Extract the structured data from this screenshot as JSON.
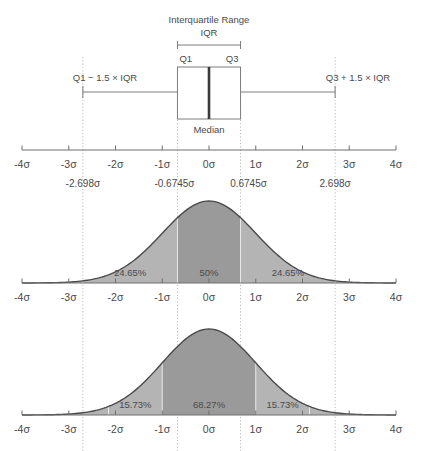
{
  "figure": {
    "title_visible": false,
    "axis": {
      "unit_suffix": "σ",
      "tick_labels": [
        "-4σ",
        "-3σ",
        "-2σ",
        "-1σ",
        "0σ",
        "1σ",
        "2σ",
        "3σ",
        "4σ"
      ],
      "tick_values": [
        -4,
        -3,
        -2,
        -1,
        0,
        1,
        2,
        3,
        4
      ],
      "range": [
        -4,
        4
      ]
    },
    "quartile_labels": {
      "lower_fence": "-2.698σ",
      "q1": "-0.6745σ",
      "q3": "0.6745σ",
      "upper_fence": "2.698σ"
    },
    "boxplot": {
      "iqr_title": "Interquartile Range",
      "iqr_abbrev": "IQR",
      "q1_label": "Q1",
      "q3_label": "Q3",
      "median_label": "Median",
      "lower_fence_label": "Q1 − 1.5 × IQR",
      "upper_fence_label": "Q3 + 1.5 × IQR",
      "q1_value": -0.6745,
      "q3_value": 0.6745,
      "median_value": 0,
      "lower_whisker_value": -2.698,
      "upper_whisker_value": 2.698
    },
    "colors": {
      "outer_fill": "#b4b4b4",
      "inner_fill": "#9a9a9a",
      "curve_stroke": "#4a4a4a",
      "axis_stroke": "#6e6e6e",
      "guide_stroke": "#b9b9b9",
      "text": "#4a4a4a",
      "median_stroke": "#3a3a3a"
    }
  },
  "chart_data": [
    {
      "type": "line",
      "name": "boxplot-panel",
      "title": "Interquartile Range",
      "xlabel": "",
      "ylabel": "",
      "xlim": [
        -4,
        4
      ],
      "grid": false,
      "tick_labels": [
        "-4σ",
        "-3σ",
        "-2σ",
        "-1σ",
        "0σ",
        "1σ",
        "2σ",
        "3σ",
        "4σ"
      ],
      "x": [
        -4,
        -3,
        -2,
        -1,
        0,
        1,
        2,
        3,
        4
      ],
      "boxplot_stats": {
        "whisker_low": -2.698,
        "q1": -0.6745,
        "median": 0,
        "q3": 0.6745,
        "whisker_high": 2.698
      },
      "annotations": [
        "Interquartile Range",
        "IQR",
        "Q1",
        "Q3",
        "Median",
        "Q1 − 1.5 × IQR",
        "Q3 + 1.5 × IQR",
        "-2.698σ",
        "-0.6745σ",
        "0.6745σ",
        "2.698σ"
      ]
    },
    {
      "type": "area",
      "name": "quartile-normal-curve",
      "title": "",
      "xlabel": "",
      "ylabel": "",
      "xlim": [
        -4,
        4
      ],
      "grid": false,
      "distribution": "standard normal",
      "tick_labels": [
        "-4σ",
        "-3σ",
        "-2σ",
        "-1σ",
        "0σ",
        "1σ",
        "2σ",
        "3σ",
        "4σ"
      ],
      "regions": [
        {
          "label": "24.65%",
          "value": 24.65,
          "from": -2.698,
          "to": -0.6745,
          "shade": "outer"
        },
        {
          "label": "50%",
          "value": 50,
          "from": -0.6745,
          "to": 0.6745,
          "shade": "inner"
        },
        {
          "label": "24.65%",
          "value": 24.65,
          "from": 0.6745,
          "to": 2.698,
          "shade": "outer"
        }
      ]
    },
    {
      "type": "area",
      "name": "sigma-normal-curve",
      "title": "",
      "xlabel": "",
      "ylabel": "",
      "xlim": [
        -4,
        4
      ],
      "grid": false,
      "distribution": "standard normal",
      "tick_labels": [
        "-4σ",
        "-3σ",
        "-2σ",
        "-1σ",
        "0σ",
        "1σ",
        "2σ",
        "3σ",
        "4σ"
      ],
      "regions": [
        {
          "label": "15.73%",
          "value": 15.73,
          "from": -2.15,
          "to": -1,
          "shade": "outer"
        },
        {
          "label": "68.27%",
          "value": 68.27,
          "from": -1,
          "to": 1,
          "shade": "inner"
        },
        {
          "label": "15.73%",
          "value": 15.73,
          "from": 1,
          "to": 2.15,
          "shade": "outer"
        }
      ]
    }
  ]
}
